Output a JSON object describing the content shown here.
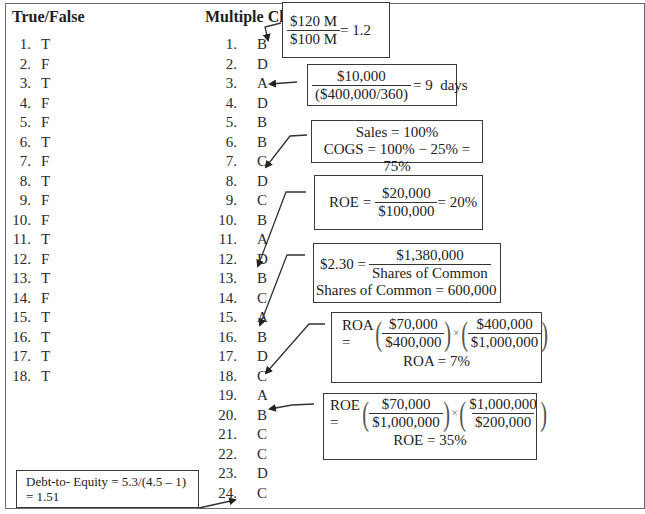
{
  "true_false": {
    "heading": "True/False",
    "items": [
      {
        "num": "1.",
        "answer": "T"
      },
      {
        "num": "2.",
        "answer": "F"
      },
      {
        "num": "3.",
        "answer": "T"
      },
      {
        "num": "4.",
        "answer": "F"
      },
      {
        "num": "5.",
        "answer": "F"
      },
      {
        "num": "6.",
        "answer": "T"
      },
      {
        "num": "7.",
        "answer": "F"
      },
      {
        "num": "8.",
        "answer": "T"
      },
      {
        "num": "9.",
        "answer": "F"
      },
      {
        "num": "10.",
        "answer": "F"
      },
      {
        "num": "11.",
        "answer": "T"
      },
      {
        "num": "12.",
        "answer": "F"
      },
      {
        "num": "13.",
        "answer": "T"
      },
      {
        "num": "14.",
        "answer": "F"
      },
      {
        "num": "15.",
        "answer": "T"
      },
      {
        "num": "16.",
        "answer": "T"
      },
      {
        "num": "17.",
        "answer": "T"
      },
      {
        "num": "18.",
        "answer": "T"
      }
    ]
  },
  "multiple_choice": {
    "heading": "Multiple Choice",
    "items": [
      {
        "num": "1.",
        "answer": "B"
      },
      {
        "num": "2.",
        "answer": "D"
      },
      {
        "num": "3.",
        "answer": "A"
      },
      {
        "num": "4.",
        "answer": "D"
      },
      {
        "num": "5.",
        "answer": "B"
      },
      {
        "num": "6.",
        "answer": "B"
      },
      {
        "num": "7.",
        "answer": "C"
      },
      {
        "num": "8.",
        "answer": "D"
      },
      {
        "num": "9.",
        "answer": "C"
      },
      {
        "num": "10.",
        "answer": "B"
      },
      {
        "num": "11.",
        "answer": "A"
      },
      {
        "num": "12.",
        "answer": "D"
      },
      {
        "num": "13.",
        "answer": "B"
      },
      {
        "num": "14.",
        "answer": "C"
      },
      {
        "num": "15.",
        "answer": "A"
      },
      {
        "num": "16.",
        "answer": "B"
      },
      {
        "num": "17.",
        "answer": "D"
      },
      {
        "num": "18.",
        "answer": "C"
      },
      {
        "num": "19.",
        "answer": "A"
      },
      {
        "num": "20.",
        "answer": "B"
      },
      {
        "num": "21.",
        "answer": "C"
      },
      {
        "num": "22.",
        "answer": "C"
      },
      {
        "num": "23.",
        "answer": "D"
      },
      {
        "num": "24.",
        "answer": "C"
      }
    ]
  },
  "explanations": {
    "current_ratio": {
      "numerator": "$120 M",
      "denominator": "$100 M",
      "result": "= 1.2",
      "points_to": "1"
    },
    "days_sales": {
      "numerator": "$10,000",
      "denominator": "($400,000/360)",
      "result": "= 9  days",
      "points_to": "3"
    },
    "cogs": {
      "line1": "Sales = 100%",
      "line2": "COGS = 100% − 25% = 75%",
      "points_to": "7"
    },
    "roe_simple": {
      "label": "ROE =",
      "numerator": "$20,000",
      "denominator": "$100,000",
      "result": "= 20%",
      "points_to": "13"
    },
    "eps": {
      "label": "$2.30 =",
      "numerator": "$1,380,000",
      "denominator": "Shares of Common",
      "line2": "Shares of Common = 600,000",
      "points_to": "15"
    },
    "roa": {
      "label": "ROA =",
      "f1_num": "$70,000",
      "f1_den": "$400,000",
      "times": "×",
      "f2_num": "$400,000",
      "f2_den": "$1,000,000",
      "result": "ROA = 7%",
      "points_to": "18"
    },
    "roe_dupont": {
      "label": "ROE =",
      "f1_num": "$70,000",
      "f1_den": "$1,000,000",
      "times": "×",
      "f2_num": "$1,000,000",
      "f2_den": "$200,000",
      "result": "ROE = 35%",
      "points_to": "20"
    },
    "debt_equity": {
      "line1": "Debt-to- Equity = 5.3/(4.5 – 1)",
      "line2": "= 1.51",
      "points_to": "24"
    }
  }
}
